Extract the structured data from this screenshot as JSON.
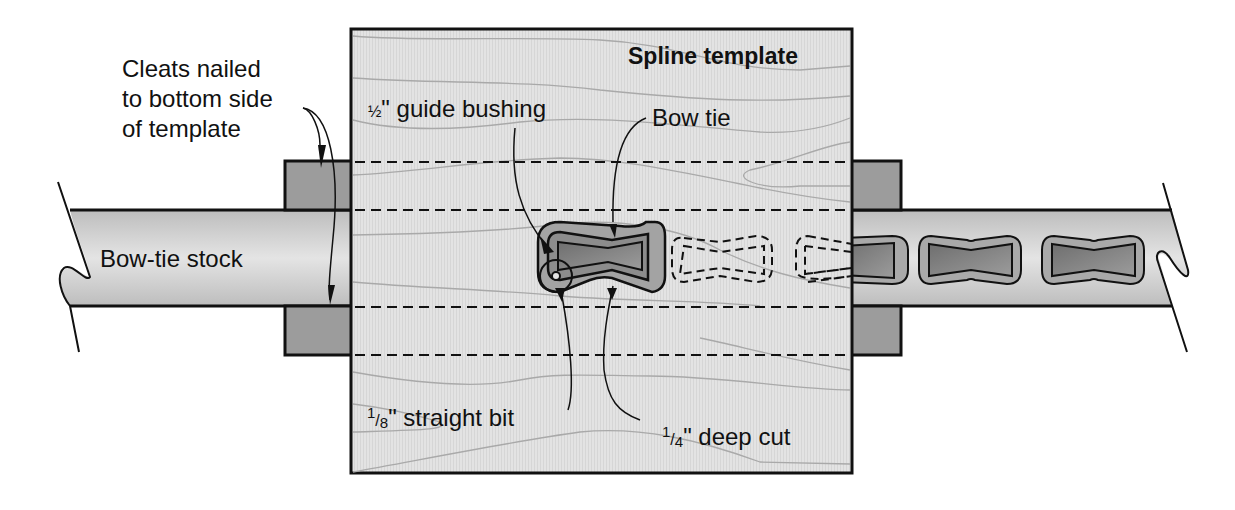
{
  "diagram": {
    "title": "Spline template",
    "labels": {
      "cleats": [
        "Cleats nailed",
        "to bottom side",
        "of template"
      ],
      "guide_bushing": {
        "fraction": "½",
        "text": "\" guide bushing"
      },
      "bow_tie": "Bow tie",
      "bow_tie_stock": "Bow-tie stock",
      "straight_bit": {
        "num": "1",
        "den": "8",
        "text": "\" straight bit"
      },
      "deep_cut": {
        "num": "1",
        "den": "4",
        "text": "\" deep cut"
      }
    },
    "colors": {
      "template_fill": "#e2e2e2",
      "cleat_fill": "#9a9a9a",
      "stock_fill": "#cfcfcf",
      "cut_outer": "#a8a8a8",
      "cut_inner": "#7c7c7c",
      "outline": "#111111",
      "grain": "#a9a9a9"
    }
  }
}
